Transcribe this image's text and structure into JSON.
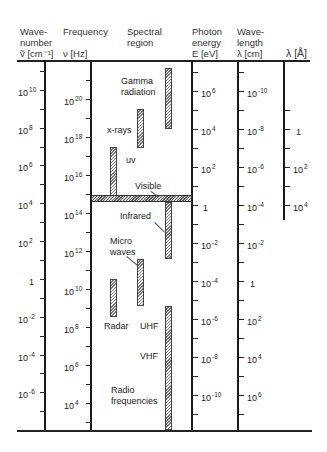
{
  "headers": {
    "wavenumber": [
      "Wave-",
      "number",
      "ṽ [cm⁻¹]"
    ],
    "frequency": [
      "Frequency",
      "ν [Hz]"
    ],
    "spectral": [
      "Spectral",
      "region"
    ],
    "photon": [
      "Photon",
      "energy",
      "E [eV]"
    ],
    "wavelength_cm": [
      "Wave-",
      "length",
      "λ [cm]"
    ],
    "wavelength_A": [
      "λ [Å]"
    ]
  },
  "scales": {
    "wavenumber": [
      {
        "base": "10",
        "exp": "10"
      },
      {
        "base": "10",
        "exp": "8"
      },
      {
        "base": "10",
        "exp": "6"
      },
      {
        "base": "10",
        "exp": "4"
      },
      {
        "base": "10",
        "exp": "2"
      },
      {
        "base": "1",
        "exp": ""
      },
      {
        "base": "10",
        "exp": "-2"
      },
      {
        "base": "10",
        "exp": "-4"
      },
      {
        "base": "10",
        "exp": "-6"
      }
    ],
    "frequency": [
      {
        "base": "10",
        "exp": "20"
      },
      {
        "base": "10",
        "exp": "18"
      },
      {
        "base": "10",
        "exp": "16"
      },
      {
        "base": "10",
        "exp": "14"
      },
      {
        "base": "10",
        "exp": "12"
      },
      {
        "base": "10",
        "exp": "10"
      },
      {
        "base": "10",
        "exp": "8"
      },
      {
        "base": "10",
        "exp": "6"
      },
      {
        "base": "10",
        "exp": "4"
      }
    ],
    "photon_energy": [
      {
        "base": "10",
        "exp": "6"
      },
      {
        "base": "10",
        "exp": "4"
      },
      {
        "base": "10",
        "exp": "2"
      },
      {
        "base": "1",
        "exp": ""
      },
      {
        "base": "10",
        "exp": "-2"
      },
      {
        "base": "10",
        "exp": "-4"
      },
      {
        "base": "10",
        "exp": "-6"
      },
      {
        "base": "10",
        "exp": "-8"
      },
      {
        "base": "10",
        "exp": "-10"
      }
    ],
    "wavelength_cm": [
      {
        "base": "10",
        "exp": "-10"
      },
      {
        "base": "10",
        "exp": "-8"
      },
      {
        "base": "10",
        "exp": "-6"
      },
      {
        "base": "10",
        "exp": "-4"
      },
      {
        "base": "10",
        "exp": "-2"
      },
      {
        "base": "1",
        "exp": ""
      },
      {
        "base": "10",
        "exp": "2"
      },
      {
        "base": "10",
        "exp": "4"
      },
      {
        "base": "10",
        "exp": "6"
      }
    ],
    "wavelength_A": [
      {
        "base": "1",
        "exp": ""
      },
      {
        "base": "10",
        "exp": "2"
      },
      {
        "base": "10",
        "exp": "4"
      }
    ]
  },
  "regions": {
    "gamma": [
      "Gamma",
      "radiation"
    ],
    "xrays": "x-rays",
    "uv": "uv",
    "visible": "Visible",
    "infrared": "Infrared",
    "microwaves": [
      "Micro",
      "waves"
    ],
    "radar": "Radar",
    "uhf": "UHF",
    "vhf": "VHF",
    "radio": [
      "Radio",
      "frequencies"
    ]
  }
}
